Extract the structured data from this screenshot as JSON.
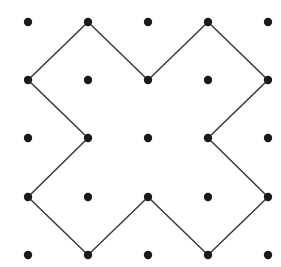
{
  "figure": {
    "background_color": "#ffffff",
    "width": 281,
    "height": 267
  },
  "lattice": {
    "name": "dot-grid",
    "rows": 5,
    "columns": 5,
    "origin_x": 28,
    "origin_y": 22,
    "spacing_x": 60,
    "spacing_y": 58.25,
    "dot_radius": 4.2,
    "dot_color": "#1a1a1a",
    "points": [
      {
        "x": 28,
        "y": 22
      },
      {
        "x": 88,
        "y": 22
      },
      {
        "x": 148,
        "y": 22
      },
      {
        "x": 208,
        "y": 22
      },
      {
        "x": 268,
        "y": 22
      },
      {
        "x": 28,
        "y": 80
      },
      {
        "x": 88,
        "y": 80
      },
      {
        "x": 148,
        "y": 80
      },
      {
        "x": 208,
        "y": 80
      },
      {
        "x": 268,
        "y": 80
      },
      {
        "x": 28,
        "y": 138
      },
      {
        "x": 88,
        "y": 138
      },
      {
        "x": 148,
        "y": 138
      },
      {
        "x": 208,
        "y": 138
      },
      {
        "x": 268,
        "y": 138
      },
      {
        "x": 28,
        "y": 197
      },
      {
        "x": 88,
        "y": 197
      },
      {
        "x": 148,
        "y": 197
      },
      {
        "x": 208,
        "y": 197
      },
      {
        "x": 268,
        "y": 197
      },
      {
        "x": 28,
        "y": 255
      },
      {
        "x": 88,
        "y": 255
      },
      {
        "x": 148,
        "y": 255
      },
      {
        "x": 208,
        "y": 255
      },
      {
        "x": 268,
        "y": 255
      }
    ]
  },
  "polygon": {
    "name": "cross-polygon",
    "stroke_color": "#3a3a3a",
    "stroke_width": 1.5,
    "fill": "none",
    "vertex_count": 12,
    "closed": true,
    "path": "M 88 22 L 148 80 L 208 22 L 268 80 L 208 138 L 268 197 L 208 255 L 148 197 L 88 255 L 28 197 L 88 138 L 28 80 Z",
    "vertices": [
      {
        "x": 88,
        "y": 22,
        "kind": "convex",
        "label": "top-left-peak"
      },
      {
        "x": 148,
        "y": 80,
        "kind": "concave",
        "label": "top-notch"
      },
      {
        "x": 208,
        "y": 22,
        "kind": "convex",
        "label": "top-right-peak"
      },
      {
        "x": 268,
        "y": 80,
        "kind": "convex",
        "label": "right-upper-peak"
      },
      {
        "x": 208,
        "y": 138,
        "kind": "concave",
        "label": "right-notch"
      },
      {
        "x": 268,
        "y": 197,
        "kind": "convex",
        "label": "right-lower-peak"
      },
      {
        "x": 208,
        "y": 255,
        "kind": "convex",
        "label": "bottom-right-peak"
      },
      {
        "x": 148,
        "y": 197,
        "kind": "concave",
        "label": "bottom-notch"
      },
      {
        "x": 88,
        "y": 255,
        "kind": "convex",
        "label": "bottom-left-peak"
      },
      {
        "x": 28,
        "y": 197,
        "kind": "convex",
        "label": "left-lower-peak"
      },
      {
        "x": 88,
        "y": 138,
        "kind": "concave",
        "label": "left-notch"
      },
      {
        "x": 28,
        "y": 80,
        "kind": "convex",
        "label": "left-upper-peak"
      }
    ]
  },
  "chart_data": {
    "type": "scatter",
    "subtitle": "",
    "xlabel": "",
    "ylabel": "",
    "xlim": [
      0,
      281
    ],
    "ylim": [
      0,
      267
    ],
    "grid": false,
    "legend": "none",
    "series": [
      {
        "name": "lattice-points",
        "marker": "filled-circle",
        "color": "#1a1a1a",
        "size": 8.4,
        "x": [
          28,
          88,
          148,
          208,
          268,
          28,
          88,
          148,
          208,
          268,
          28,
          88,
          148,
          208,
          268,
          28,
          88,
          148,
          208,
          268,
          28,
          88,
          148,
          208,
          268
        ],
        "y": [
          22,
          22,
          22,
          22,
          22,
          80,
          80,
          80,
          80,
          80,
          138,
          138,
          138,
          138,
          138,
          197,
          197,
          197,
          197,
          197,
          255,
          255,
          255,
          255,
          255
        ]
      },
      {
        "name": "cross-polygon-outline",
        "marker": "none",
        "color": "#3a3a3a",
        "linewidth": 1.5,
        "closed": true,
        "x": [
          88,
          148,
          208,
          268,
          208,
          268,
          208,
          148,
          88,
          28,
          88,
          28,
          88
        ],
        "y": [
          22,
          80,
          22,
          80,
          138,
          197,
          255,
          197,
          255,
          197,
          138,
          80,
          22
        ]
      }
    ],
    "annotations": []
  }
}
